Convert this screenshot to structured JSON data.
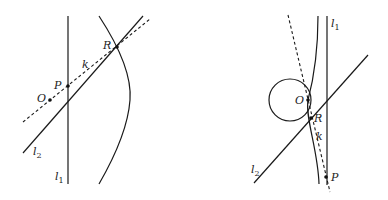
{
  "figures": [
    {
      "id": "left",
      "labels": {
        "R": "R",
        "k": "k",
        "P": "P",
        "O": "O",
        "l2": "l",
        "l2_sub": "2",
        "l1": "l",
        "l1_sub": "1"
      }
    },
    {
      "id": "right",
      "labels": {
        "l1": "l",
        "l1_sub": "1",
        "O": "O",
        "R": "R",
        "k": "k",
        "l2": "l",
        "l2_sub": "2",
        "P": "P"
      }
    }
  ],
  "colors": {
    "stroke": "#1a1a1a",
    "background": "#ffffff"
  }
}
